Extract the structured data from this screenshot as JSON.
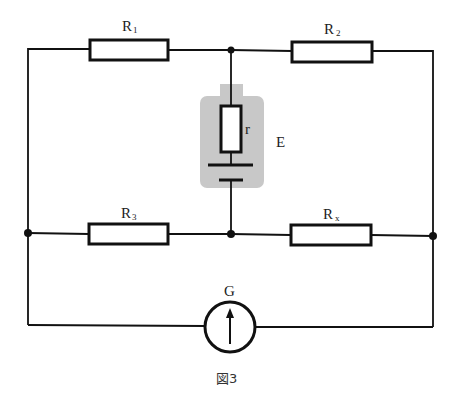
{
  "figure": {
    "caption": "図3",
    "type": "Wheatstone bridge circuit"
  },
  "components": {
    "R1": {
      "label": "R",
      "sub": "1"
    },
    "R2": {
      "label": "R",
      "sub": "2"
    },
    "R3": {
      "label": "R",
      "sub": "3"
    },
    "Rx": {
      "label": "R",
      "sub": "x"
    },
    "internal_resistance": {
      "label": "r"
    },
    "battery": {
      "label": "E"
    },
    "galvanometer": {
      "label": "G"
    }
  },
  "colors": {
    "wire": "#111111",
    "battery_highlight": "#c8c8c8",
    "background": "#ffffff"
  }
}
